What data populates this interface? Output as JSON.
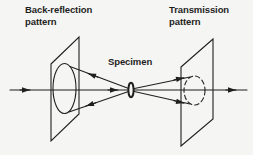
{
  "page": {
    "background": "#f5f5f3",
    "ink": "#1f1f1f"
  },
  "diagram": {
    "back_reflection_label": {
      "line1": "Back-reflection",
      "line2": "pattern"
    },
    "transmission_label": {
      "line1": "Transmission",
      "line2": "pattern"
    },
    "specimen_label": "Specimen"
  }
}
